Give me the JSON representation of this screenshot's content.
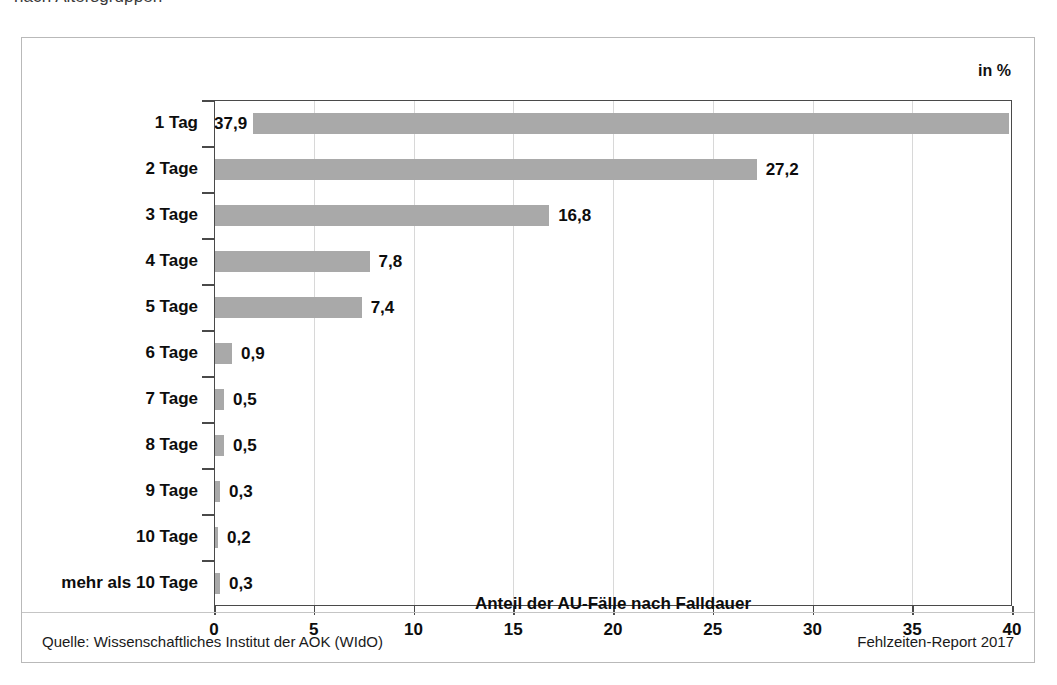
{
  "headline_cutoff": "nach Altersgruppen",
  "unit_label": "in %",
  "footer": {
    "source": "Quelle: Wissenschaftliches Institut der AOK (WIdO)",
    "report": "Fehlzeiten-Report 2017"
  },
  "chart_data": {
    "type": "bar",
    "orientation": "horizontal",
    "title": "",
    "xlabel": "Anteil der AU-Fälle nach Falldauer",
    "ylabel": "",
    "unit": "in %",
    "xlim": [
      0,
      40
    ],
    "xticks": [
      0,
      5,
      10,
      15,
      20,
      25,
      30,
      35,
      40
    ],
    "xtick_labels": [
      "0",
      "5",
      "10",
      "15",
      "20",
      "25",
      "30",
      "35",
      "40"
    ],
    "grid": true,
    "legend": false,
    "bar_color": "#a9a9a9",
    "categories": [
      "1 Tag",
      "2 Tage",
      "3 Tage",
      "4 Tage",
      "5 Tage",
      "6 Tage",
      "7 Tage",
      "8 Tage",
      "9 Tage",
      "10 Tage",
      "mehr als 10 Tage"
    ],
    "values": [
      37.9,
      27.2,
      16.8,
      7.8,
      7.4,
      0.9,
      0.5,
      0.5,
      0.3,
      0.2,
      0.3
    ],
    "value_labels": [
      "37,9",
      "27,2",
      "16,8",
      "7,8",
      "7,4",
      "0,9",
      "0,5",
      "0,5",
      "0,3",
      "0,2",
      "0,3"
    ]
  }
}
